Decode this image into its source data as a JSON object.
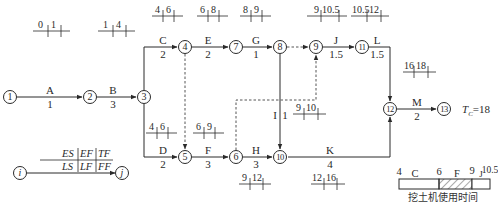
{
  "total_duration": {
    "symbol": "T",
    "subscript": "C",
    "value": "=18"
  },
  "nodes": [
    {
      "id": "1",
      "x": 10,
      "y": 97
    },
    {
      "id": "2",
      "x": 90,
      "y": 97
    },
    {
      "id": "3",
      "x": 144,
      "y": 97
    },
    {
      "id": "4",
      "x": 185,
      "y": 47
    },
    {
      "id": "5",
      "x": 185,
      "y": 157
    },
    {
      "id": "6",
      "x": 236,
      "y": 157
    },
    {
      "id": "7",
      "x": 236,
      "y": 47
    },
    {
      "id": "8",
      "x": 280,
      "y": 47
    },
    {
      "id": "9",
      "x": 316,
      "y": 47
    },
    {
      "id": "10",
      "x": 280,
      "y": 157
    },
    {
      "id": "11",
      "x": 362,
      "y": 47
    },
    {
      "id": "12",
      "x": 390,
      "y": 109
    },
    {
      "id": "13",
      "x": 444,
      "y": 109
    }
  ],
  "activities": [
    {
      "name": "A",
      "duration": "1",
      "from": "1",
      "to": "2",
      "es": "0",
      "ef": "1"
    },
    {
      "name": "B",
      "duration": "3",
      "from": "2",
      "to": "3",
      "es": "1",
      "ef": "4"
    },
    {
      "name": "C",
      "duration": "2",
      "from": "3",
      "to": "4",
      "es": "4",
      "ef": "6"
    },
    {
      "name": "D",
      "duration": "2",
      "from": "3",
      "to": "5",
      "es": "4",
      "ef": "6"
    },
    {
      "name": "E",
      "duration": "2",
      "from": "4",
      "to": "7",
      "es": "6",
      "ef": "8"
    },
    {
      "name": "F",
      "duration": "3",
      "from": "5",
      "to": "6",
      "es": "6",
      "ef": "9"
    },
    {
      "name": "G",
      "duration": "1",
      "from": "7",
      "to": "8",
      "es": "8",
      "ef": "9"
    },
    {
      "name": "H",
      "duration": "3",
      "from": "6",
      "to": "10",
      "es": "9",
      "ef": "12"
    },
    {
      "name": "I",
      "duration": "1",
      "from": "8",
      "to": "10",
      "es": "9",
      "ef": "10"
    },
    {
      "name": "J",
      "duration": "1.5",
      "from": "9",
      "to": "11",
      "es": "9",
      "ef": "10.5"
    },
    {
      "name": "K",
      "duration": "4",
      "from": "10",
      "to": "12",
      "es": "12",
      "ef": "16"
    },
    {
      "name": "L",
      "duration": "1.5",
      "from": "11",
      "to": "12",
      "es": "10.5",
      "ef": "12"
    },
    {
      "name": "M",
      "duration": "2",
      "from": "12",
      "to": "13",
      "es": "16",
      "ef": "18"
    }
  ],
  "dummy_activities": [
    {
      "from": "4",
      "to": "5"
    },
    {
      "from": "8",
      "to": "9"
    },
    {
      "from": "6",
      "to": "9"
    }
  ],
  "legend": {
    "top_row": [
      "ES",
      "EF",
      "TF"
    ],
    "bottom_row": [
      "LS",
      "LF",
      "FF"
    ],
    "start_node": "i",
    "end_node": "j"
  },
  "excavator_bar": {
    "caption": "挖土机使用时间",
    "ticks": [
      "4",
      "6",
      "9",
      "10.5"
    ],
    "segments": [
      {
        "label": "C",
        "from": "4",
        "to": "6",
        "hatched": false
      },
      {
        "label": "F",
        "from": "6",
        "to": "9",
        "hatched": true
      },
      {
        "label": "J",
        "from": "9",
        "to": "10.5",
        "hatched": false
      }
    ]
  }
}
